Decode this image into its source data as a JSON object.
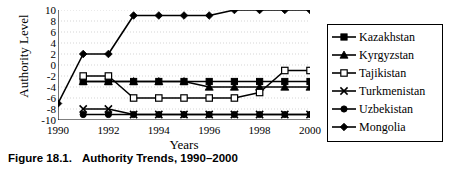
{
  "caption": {
    "number": "Figure 18.1.",
    "title": "Authority Trends, 1990–2000"
  },
  "axes": {
    "ylabel": "Authority Level",
    "xlabel": "Years",
    "ytick_labels": [
      "10",
      "8",
      "6",
      "4",
      "2",
      "0",
      "-2",
      "-4",
      "-6",
      "-8",
      "-10"
    ],
    "xtick_labels": [
      "1990",
      "1992",
      "1994",
      "1996",
      "1998",
      "2000"
    ]
  },
  "legend": {
    "items": [
      {
        "label": "Kazakhstan",
        "marker": "filled-square-marker",
        "color": "#000000"
      },
      {
        "label": "Kyrgyzstan",
        "marker": "filled-triangle-marker",
        "color": "#000000"
      },
      {
        "label": "Tajikistan",
        "marker": "open-square-marker",
        "color": "#000000"
      },
      {
        "label": "Turkmenistan",
        "marker": "cross-x-marker",
        "color": "#000000"
      },
      {
        "label": "Uzbekistan",
        "marker": "filled-circle-marker",
        "color": "#000000"
      },
      {
        "label": "Mongolia",
        "marker": "filled-diamond-marker",
        "color": "#000000"
      }
    ]
  },
  "chart_data": {
    "type": "line",
    "title": "Authority Trends, 1990–2000",
    "xlabel": "Years",
    "ylabel": "Authority Level",
    "x": [
      1990,
      1991,
      1992,
      1993,
      1994,
      1995,
      1996,
      1997,
      1998,
      1999,
      2000
    ],
    "xlim": [
      1990,
      2000
    ],
    "ylim": [
      -10,
      10
    ],
    "ytick_step": 2,
    "grid": true,
    "legend_position": "right-outside",
    "series": [
      {
        "name": "Kazakhstan",
        "marker": "filled-square-marker",
        "values": [
          null,
          -3,
          -3,
          -3,
          -3,
          -3,
          -3,
          -3,
          -3,
          -3,
          -3
        ]
      },
      {
        "name": "Kyrgyzstan",
        "marker": "filled-triangle-marker",
        "values": [
          null,
          -3,
          -3,
          -3,
          -3,
          -3,
          -4,
          -4,
          -4,
          -4,
          -4
        ]
      },
      {
        "name": "Tajikistan",
        "marker": "open-square-marker",
        "values": [
          null,
          -2,
          -2,
          -6,
          -6,
          -6,
          -6,
          -6,
          -5,
          -1,
          -1
        ]
      },
      {
        "name": "Turkmenistan",
        "marker": "cross-x-marker",
        "values": [
          null,
          -8,
          -8,
          -9,
          -9,
          -9,
          -9,
          -9,
          -9,
          -9,
          -9
        ]
      },
      {
        "name": "Uzbekistan",
        "marker": "filled-circle-marker",
        "values": [
          null,
          -9,
          -9,
          -9,
          -9,
          -9,
          -9,
          -9,
          -9,
          -9,
          -9
        ]
      },
      {
        "name": "Mongolia",
        "marker": "filled-diamond-marker",
        "values": [
          -7,
          2,
          2,
          9,
          9,
          9,
          9,
          10,
          10,
          10,
          10
        ]
      }
    ]
  }
}
